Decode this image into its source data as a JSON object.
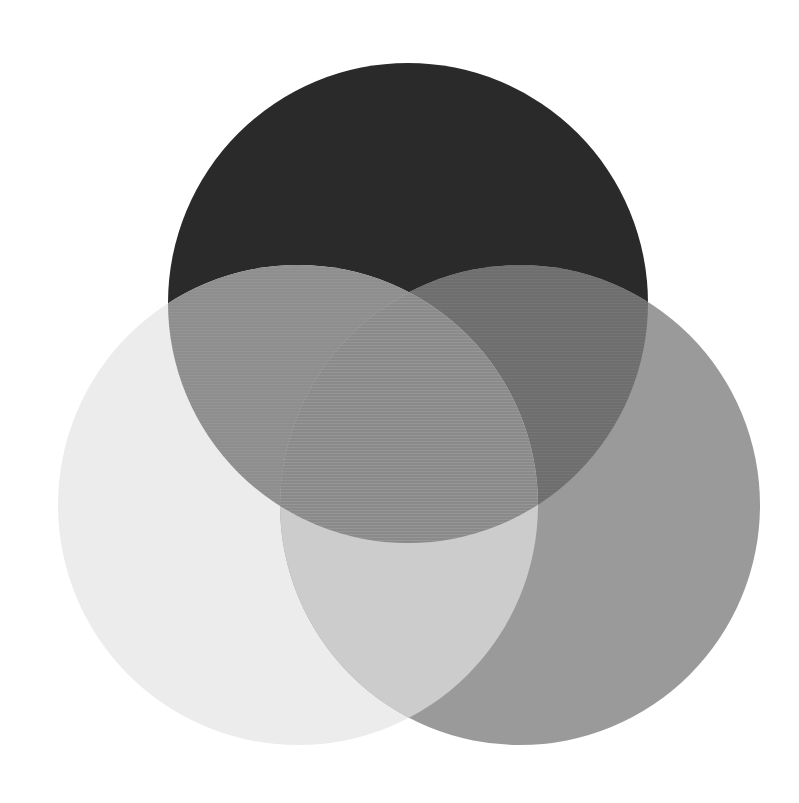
{
  "canvas": {
    "width": 799,
    "height": 803,
    "background_color": "#ffffff",
    "title": "Three-circle Venn diagram"
  },
  "chart_data": {
    "type": "venn",
    "title": "",
    "subtitle": "",
    "xlabel": "",
    "ylabel": "",
    "grid": false,
    "legend_position": "none",
    "annotations": [],
    "set_count": 3,
    "radius": 240,
    "sets": [
      {
        "id": "top",
        "name": "Set A",
        "label": "",
        "cx": 408,
        "cy": 303,
        "r": 240,
        "fill": "#2a2a2a",
        "alone_color": "#2a2a2a",
        "draw_order": 1
      },
      {
        "id": "left",
        "name": "Set B",
        "label": "",
        "cx": 298,
        "cy": 505,
        "r": 240,
        "fill": "#ececec",
        "alone_color": "#ececec",
        "draw_order": 2
      },
      {
        "id": "right",
        "name": "Set C",
        "label": "",
        "cx": 520,
        "cy": 505,
        "r": 240,
        "fill": "#9a9a9a",
        "alone_color": "#9a9a9a",
        "draw_order": 3
      }
    ],
    "regions": [
      {
        "id": "top-only",
        "members": [
          "top"
        ],
        "color": "#2a2a2a",
        "label": ""
      },
      {
        "id": "left-only",
        "members": [
          "left"
        ],
        "color": "#ececec",
        "label": ""
      },
      {
        "id": "right-only",
        "members": [
          "right"
        ],
        "color": "#9a9a9a",
        "label": ""
      },
      {
        "id": "top-left",
        "members": [
          "top",
          "left"
        ],
        "color": "#8e8e8e",
        "label": ""
      },
      {
        "id": "top-right",
        "members": [
          "top",
          "right"
        ],
        "color": "#6e6e6e",
        "label": ""
      },
      {
        "id": "left-right",
        "members": [
          "left",
          "right"
        ],
        "color": "#cccccc",
        "label": ""
      },
      {
        "id": "top-left-right",
        "members": [
          "top",
          "left",
          "right"
        ],
        "color": "#8a8a8a",
        "label": ""
      }
    ],
    "texture": {
      "enabled": true,
      "kind": "horizontal-scanlines",
      "opacity": 0.05
    }
  }
}
